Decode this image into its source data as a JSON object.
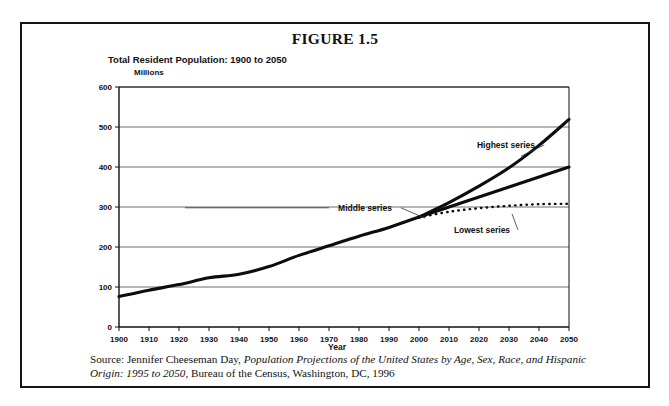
{
  "figure": {
    "title": "FIGURE 1.5",
    "subtitle": "Total Resident Population: 1900 to 2050"
  },
  "source": {
    "prefix": "Source: Jennifer Cheeseman Day, ",
    "italic_title": "Population Projections of the United States by Age, Sex, Race, and Hispanic Origin: 1995 to 2050",
    "suffix": ", Bureau of the Census, Washington, DC, 1996"
  },
  "chart_data": {
    "type": "line",
    "title": "Total Resident Population: 1900 to 2050",
    "xlabel": "Year",
    "ylabel": "Millions",
    "xlim": [
      1900,
      2050
    ],
    "ylim": [
      0,
      600
    ],
    "ytick_step": 100,
    "xtick_step": 10,
    "grid": "horizontal",
    "legend": "annotations-inline",
    "xticks": [
      "1900",
      "1910",
      "1920",
      "1930",
      "1940",
      "1950",
      "1960",
      "1970",
      "1980",
      "1990",
      "2000",
      "2010",
      "2020",
      "2030",
      "2040",
      "2050"
    ],
    "yticks": [
      "0",
      "100",
      "200",
      "300",
      "400",
      "500",
      "600"
    ],
    "series": [
      {
        "name": "Historical",
        "style": "solid-thick",
        "x": [
          1900,
          1910,
          1920,
          1930,
          1940,
          1950,
          1960,
          1970,
          1980,
          1990,
          2000
        ],
        "values": [
          76,
          92,
          106,
          123,
          132,
          151,
          179,
          203,
          227,
          249,
          275
        ]
      },
      {
        "name": "Highest series",
        "style": "solid-thick",
        "x": [
          2000,
          2010,
          2020,
          2030,
          2040,
          2050
        ],
        "values": [
          275,
          311,
          352,
          398,
          454,
          519
        ]
      },
      {
        "name": "Middle series",
        "style": "solid-thick",
        "x": [
          2000,
          2010,
          2020,
          2030,
          2040,
          2050
        ],
        "values": [
          275,
          300,
          325,
          350,
          375,
          400
        ]
      },
      {
        "name": "Lowest series",
        "style": "dotted",
        "x": [
          2000,
          2010,
          2020,
          2030,
          2040,
          2050
        ],
        "values": [
          274,
          288,
          297,
          303,
          307,
          308
        ]
      }
    ],
    "annotations": [
      {
        "label": "Highest series",
        "x": 2029,
        "y": 455
      },
      {
        "label": "Middle series",
        "x": 1982,
        "y": 298
      },
      {
        "label": "Lowest series",
        "x": 2021,
        "y": 243
      }
    ]
  }
}
